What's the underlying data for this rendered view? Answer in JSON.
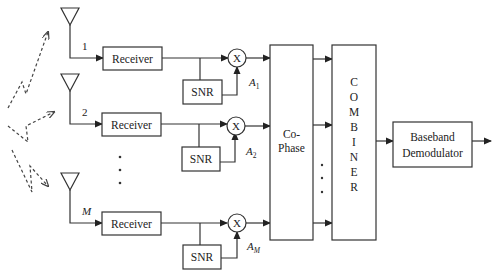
{
  "diagram": {
    "branches": [
      {
        "index_label": "1",
        "receiver_label": "Receiver",
        "snr_label": "SNR",
        "mult_label": "X",
        "gain_label": "A",
        "gain_sub": "1"
      },
      {
        "index_label": "2",
        "receiver_label": "Receiver",
        "snr_label": "SNR",
        "mult_label": "X",
        "gain_label": "A",
        "gain_sub": "2"
      },
      {
        "index_label": "M",
        "receiver_label": "Receiver",
        "snr_label": "SNR",
        "mult_label": "X",
        "gain_label": "A",
        "gain_sub": "M"
      }
    ],
    "cophase": {
      "line1": "Co-",
      "line2": "Phase"
    },
    "combiner": {
      "letters": [
        "C",
        "O",
        "M",
        "B",
        "I",
        "N",
        "E",
        "R"
      ]
    },
    "demodulator": {
      "line1": "Baseband",
      "line2": "Demodulator"
    },
    "ellipsis": "·"
  }
}
